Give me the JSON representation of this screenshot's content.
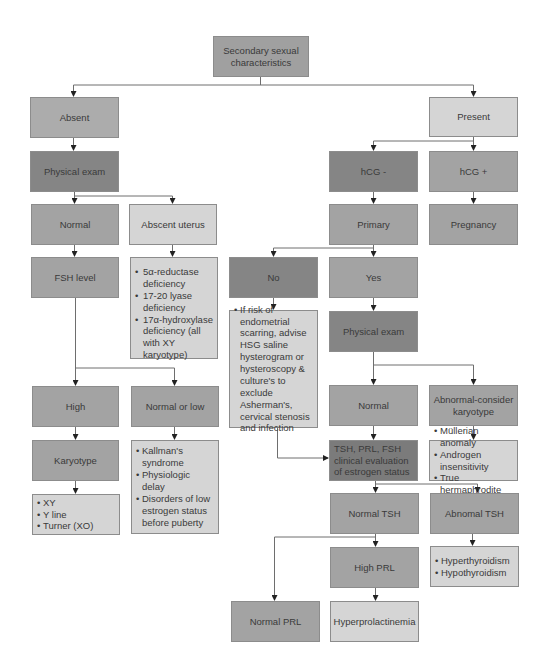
{
  "diagram": {
    "root": {
      "label": "Secondary sexual characteristics"
    },
    "left_branch": {
      "absent": {
        "label": "Absent"
      },
      "physical_exam": {
        "label": "Physical exam"
      },
      "normal": {
        "label": "Normal"
      },
      "abscent_uterus": {
        "label": "Abscent uterus"
      },
      "uterus_causes": {
        "items": [
          "5α-reductase deficiency",
          "17-20 lyase deficiency",
          "17α-hydroxylase deficiency (all with XY karyotype)"
        ]
      },
      "fsh_level": {
        "label": "FSH level"
      },
      "high": {
        "label": "High"
      },
      "normal_or_low": {
        "label": "Normal or low"
      },
      "karyotype": {
        "label": "Karyotype"
      },
      "karyotype_results": {
        "items": [
          "XY",
          "Y line",
          "Turner (XO)"
        ]
      },
      "low_causes": {
        "items": [
          "Kallman's syndrome",
          "Physiologic delay",
          "Disorders of low estrogen status before puberty"
        ]
      }
    },
    "right_branch": {
      "present": {
        "label": "Present"
      },
      "hcg_negative": {
        "label": "hCG -"
      },
      "hcg_positive": {
        "label": "hCG  +"
      },
      "primary": {
        "label": "Primary"
      },
      "pregnancy": {
        "label": "Pregnancy"
      },
      "no": {
        "label": "No"
      },
      "yes": {
        "label": "Yes"
      },
      "no_advice": {
        "items": [
          "If risk of endometrial scarring, advise HSG saline hysterogram or hysteroscopy & culture's to exclude Asherman's, cervical stenosis and infection"
        ]
      },
      "physical_exam": {
        "label": "Physical exam"
      },
      "normal": {
        "label": "Normal"
      },
      "abnormal": {
        "label": "Abnormal-consider karyotype"
      },
      "abnormal_causes": {
        "items": [
          "Müllerian anomaly",
          "Androgen insensitivity",
          "True hermaphrodite"
        ]
      },
      "tsh_eval": {
        "label": "TSH, PRL, FSH clinical evaluation of estrogen status"
      },
      "normal_tsh": {
        "label": "Normal TSH"
      },
      "abnormal_tsh": {
        "label": "Abnomal TSH"
      },
      "thyroid_causes": {
        "items": [
          "Hyperthyroidism",
          "Hypothyroidism"
        ]
      },
      "high_prl": {
        "label": "High PRL"
      },
      "normal_prl": {
        "label": "Normal PRL"
      },
      "hyperprolactinemia": {
        "label": "Hyperprolactinemia"
      }
    }
  },
  "colors": {
    "line": "#6e6e6e",
    "box_border": "#8c8c8c",
    "dark": "#858585",
    "darker": "#7b7b7b",
    "mid": "#a3a3a3",
    "light": "#d5d5d5"
  }
}
